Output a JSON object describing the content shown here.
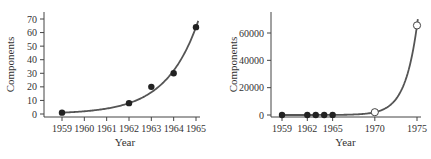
{
  "chart_data": [
    {
      "type": "scatter",
      "title": "",
      "xlabel": "Year",
      "ylabel": "Components",
      "x_ticks": [
        "1959",
        "1960",
        "1961",
        "1962",
        "1963",
        "1964",
        "1965"
      ],
      "y_ticks": [
        "0",
        "10",
        "20",
        "30",
        "40",
        "50",
        "60",
        "70"
      ],
      "xlim": [
        1959,
        1965
      ],
      "ylim": [
        0,
        70
      ],
      "grid": false,
      "series": [
        {
          "name": "observed",
          "marker": "filled-circle",
          "x": [
            1959,
            1962,
            1963,
            1964,
            1965
          ],
          "y": [
            1,
            8,
            20,
            30,
            64
          ]
        },
        {
          "name": "exponential fit",
          "style": "line",
          "formula": "y = 2^(x-1959)",
          "x_range": [
            1959,
            1965.1
          ]
        }
      ]
    },
    {
      "type": "scatter",
      "title": "",
      "xlabel": "Year",
      "ylabel": "Components",
      "x_ticks": [
        "1959",
        "1962",
        "1965",
        "1970",
        "1975"
      ],
      "y_ticks": [
        "0",
        "20000",
        "40000",
        "60000"
      ],
      "xlim": [
        1959,
        1975
      ],
      "ylim": [
        0,
        65536
      ],
      "grid": false,
      "series": [
        {
          "name": "observed",
          "marker": "filled-circle",
          "x": [
            1959,
            1962,
            1963,
            1964,
            1965
          ],
          "y": [
            1,
            8,
            20,
            30,
            64
          ]
        },
        {
          "name": "predicted",
          "marker": "open-circle",
          "x": [
            1970,
            1975
          ],
          "y": [
            2048,
            65536
          ]
        },
        {
          "name": "exponential fit",
          "style": "line",
          "formula": "y = 2^(x-1959)",
          "x_range": [
            1959,
            1975.1
          ]
        }
      ]
    }
  ]
}
